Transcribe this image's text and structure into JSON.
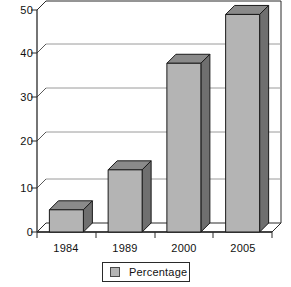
{
  "chart_data": {
    "type": "bar",
    "title": "",
    "subtitle": "",
    "xlabel": "",
    "ylabel": "",
    "categories": [
      "1984",
      "1989",
      "2000",
      "2005"
    ],
    "values": [
      5,
      14,
      38,
      49
    ],
    "series": [
      {
        "name": "Percentage",
        "values": [
          5,
          14,
          38,
          49
        ]
      }
    ],
    "ylim": [
      0,
      50
    ],
    "ytick_labels": [
      "0",
      "10",
      "20",
      "30",
      "40",
      "50"
    ],
    "ytick_values": [
      0,
      10,
      20,
      30,
      40,
      50
    ],
    "grid": true,
    "grid_axis": "y",
    "legend": {
      "position": "bottom",
      "entries": [
        {
          "label": "Percentage",
          "color": "#b4b4b4"
        }
      ]
    },
    "style": {
      "three_d": true,
      "bar_face_color": "#b4b4b4",
      "bar_top_color": "#8a8a8a",
      "bar_side_color": "#6f6f6f",
      "bar_edge_color": "#1a1a1a",
      "axis_color": "#2a2a2a",
      "grid_color": "#9a9a9a",
      "background_color": "#ffffff"
    }
  },
  "axes": {
    "y_ticks": [
      {
        "label": "50",
        "value": 50
      },
      {
        "label": "40",
        "value": 40
      },
      {
        "label": "30",
        "value": 30
      },
      {
        "label": "20",
        "value": 20
      },
      {
        "label": "10",
        "value": 10
      },
      {
        "label": "0",
        "value": 0
      }
    ],
    "x_ticks": [
      {
        "label": "1984"
      },
      {
        "label": "1989"
      },
      {
        "label": "2000"
      },
      {
        "label": "2005"
      }
    ]
  },
  "legend": {
    "entry_label": "Percentage"
  }
}
